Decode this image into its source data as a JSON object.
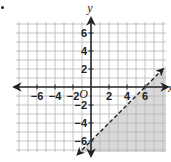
{
  "chart_data": {
    "type": "area",
    "title": "",
    "xlabel": "x",
    "ylabel": "y",
    "origin_label": "O",
    "xlim": [
      -8,
      8
    ],
    "ylim": [
      -8,
      7
    ],
    "grid": true,
    "grid_step": 1,
    "x_ticks": [
      -6,
      -4,
      -2,
      2,
      4,
      6
    ],
    "y_ticks": [
      6,
      4,
      2,
      -2,
      -4,
      -6
    ],
    "x_tick_labels": [
      "−6",
      "−4",
      "−2",
      "2",
      "4",
      "6"
    ],
    "y_tick_labels": [
      "6",
      "4",
      "2",
      "−2",
      "−4",
      "−6"
    ],
    "boundary_line": {
      "equation": "y = x - 6",
      "slope": 1,
      "intercept": -6,
      "style": "dashed",
      "points": [
        [
          0,
          -6
        ],
        [
          6,
          0
        ]
      ]
    },
    "shaded_region": {
      "inequality": "y < x - 6",
      "side": "below-right",
      "color": "#d9d9d9"
    },
    "colors": {
      "grid": "#b5b5b5",
      "axis": "#222222",
      "line": "#222222",
      "shade": "#d9d9d9"
    }
  }
}
